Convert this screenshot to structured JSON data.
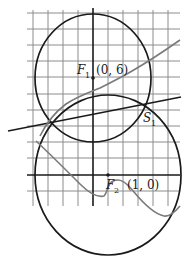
{
  "diagram": {
    "type": "coordinate-geometry",
    "grid": {
      "x_lines": [
        33,
        48,
        63,
        78,
        108,
        123,
        138,
        153,
        168
      ],
      "y_lines": [
        13,
        29,
        45,
        61,
        94,
        110,
        126,
        142,
        158,
        191,
        206
      ],
      "color": "#8c8c8c"
    },
    "axes": {
      "color": "#1a1a1a"
    },
    "points": [
      {
        "id": "F1",
        "name": "F",
        "subscript": "1",
        "coords": "(0, 6)"
      },
      {
        "id": "F2",
        "name": "F",
        "subscript": "2",
        "coords": "(1, 0)"
      },
      {
        "id": "S1",
        "name": "S",
        "subscript": "1"
      }
    ],
    "circles": [
      {
        "center": "F1",
        "color": "#1a1a1a"
      },
      {
        "center": "F2",
        "color": "#1a1a1a"
      }
    ],
    "curves": [
      {
        "name": "upper-gray-curve",
        "color": "#7a7a7a"
      },
      {
        "name": "lower-gray-curve",
        "color": "#7a7a7a"
      }
    ],
    "line": {
      "name": "secant-line",
      "color": "#1a1a1a"
    }
  }
}
